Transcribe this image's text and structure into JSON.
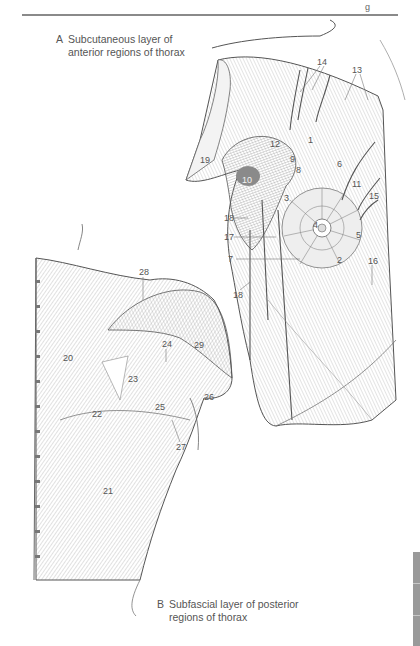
{
  "header": {
    "running_head_fragment": "g"
  },
  "figures": [
    {
      "letter": "A",
      "caption": "Subcutaneous layer of\nanterior regions of thorax"
    },
    {
      "letter": "B",
      "caption": "Subfascial layer of posterior\nregions of thorax"
    }
  ],
  "labels_a": [
    {
      "id": "1",
      "x": 308,
      "y": 136
    },
    {
      "id": "2",
      "x": 338,
      "y": 256
    },
    {
      "id": "3",
      "x": 284,
      "y": 194
    },
    {
      "id": "4",
      "x": 313,
      "y": 221
    },
    {
      "id": "5",
      "x": 356,
      "y": 231
    },
    {
      "id": "6",
      "x": 337,
      "y": 160
    },
    {
      "id": "7",
      "x": 228,
      "y": 255
    },
    {
      "id": "8",
      "x": 296,
      "y": 166
    },
    {
      "id": "9",
      "x": 290,
      "y": 155
    },
    {
      "id": "10",
      "x": 242,
      "y": 176
    },
    {
      "id": "11",
      "x": 352,
      "y": 180
    },
    {
      "id": "12",
      "x": 270,
      "y": 140
    },
    {
      "id": "13",
      "x": 352,
      "y": 66
    },
    {
      "id": "14",
      "x": 317,
      "y": 58
    },
    {
      "id": "15",
      "x": 369,
      "y": 192
    },
    {
      "id": "16",
      "x": 368,
      "y": 257
    },
    {
      "id": "17",
      "x": 224,
      "y": 233
    },
    {
      "id": "18",
      "x": 224,
      "y": 214
    },
    {
      "id": "18",
      "x": 233,
      "y": 291
    },
    {
      "id": "19",
      "x": 200,
      "y": 156
    }
  ],
  "labels_b": [
    {
      "id": "20",
      "x": 63,
      "y": 354
    },
    {
      "id": "21",
      "x": 103,
      "y": 487
    },
    {
      "id": "22",
      "x": 92,
      "y": 410
    },
    {
      "id": "23",
      "x": 128,
      "y": 375
    },
    {
      "id": "24",
      "x": 162,
      "y": 340
    },
    {
      "id": "25",
      "x": 155,
      "y": 403
    },
    {
      "id": "26",
      "x": 204,
      "y": 393
    },
    {
      "id": "27",
      "x": 176,
      "y": 443
    },
    {
      "id": "28",
      "x": 139,
      "y": 268
    },
    {
      "id": "29",
      "x": 194,
      "y": 341
    }
  ],
  "side_tab": {
    "color": "#9a9a9a"
  }
}
